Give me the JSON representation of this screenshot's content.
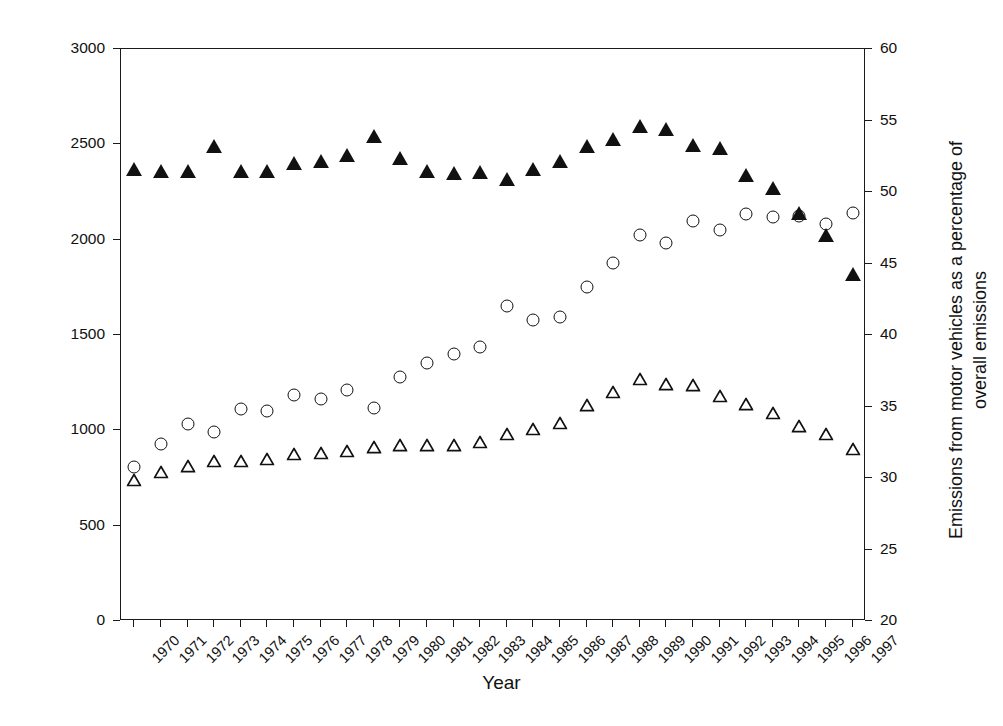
{
  "axes": {
    "x": {
      "label": "Year",
      "ticks": [
        "1970",
        "1971",
        "1972",
        "1973",
        "1974",
        "1975",
        "1976",
        "1977",
        "1978",
        "1979",
        "1980",
        "1981",
        "1982",
        "1983",
        "1984",
        "1985",
        "1986",
        "1987",
        "1988",
        "1989",
        "1990",
        "1991",
        "1992",
        "1993",
        "1994",
        "1995",
        "1996",
        "1997"
      ]
    },
    "y_left": {
      "label": "Annual emission in ktonnes",
      "ticks": [
        "0",
        "500",
        "1000",
        "1500",
        "2000",
        "2500",
        "3000"
      ],
      "min": 0,
      "max": 3000
    },
    "y_right": {
      "label": "Emissions from motor vehicles as a percentage of overall emissions",
      "ticks": [
        "20",
        "25",
        "30",
        "35",
        "40",
        "45",
        "50",
        "55",
        "60"
      ],
      "min": 20,
      "max": 60
    }
  },
  "chart_data": {
    "type": "scatter",
    "title": "",
    "xlabel": "Year",
    "ylabel": "Annual emission in ktonnes",
    "y2label": "Emissions from motor vehicles as a percentage of overall emissions",
    "grid": false,
    "legend": "none",
    "xlim": [
      1970,
      1997
    ],
    "ylim": [
      0,
      3000
    ],
    "y2lim": [
      20,
      60
    ],
    "categories": [
      "1970",
      "1971",
      "1972",
      "1973",
      "1974",
      "1975",
      "1976",
      "1977",
      "1978",
      "1979",
      "1980",
      "1981",
      "1982",
      "1983",
      "1984",
      "1985",
      "1986",
      "1987",
      "1988",
      "1989",
      "1990",
      "1991",
      "1992",
      "1993",
      "1994",
      "1995",
      "1996",
      "1997"
    ],
    "series": [
      {
        "name": "Total annual emission",
        "marker": "open-circle",
        "axis": "left",
        "unit": "ktonnes",
        "values": [
          810,
          930,
          1035,
          990,
          1110,
          1100,
          1185,
          1165,
          1210,
          1115,
          1280,
          1355,
          1400,
          1435,
          1650,
          1580,
          1595,
          1750,
          1880,
          2025,
          1985,
          2100,
          2050,
          2135,
          2120,
          2125,
          2080,
          2140
        ]
      },
      {
        "name": "Emission from motor vehicles",
        "marker": "open-triangle",
        "axis": "left",
        "unit": "ktonnes",
        "values": [
          745,
          785,
          815,
          845,
          845,
          855,
          880,
          885,
          895,
          915,
          925,
          925,
          925,
          945,
          985,
          1010,
          1045,
          1135,
          1205,
          1275,
          1245,
          1240,
          1185,
          1140,
          1095,
          1025,
          985,
          905
        ]
      },
      {
        "name": "Motor vehicles share of overall emissions",
        "marker": "filled-triangle",
        "axis": "right",
        "unit": "%",
        "values": [
          51.6,
          51.5,
          51.5,
          53.2,
          51.5,
          51.5,
          52.0,
          52.2,
          52.6,
          53.9,
          52.4,
          51.5,
          51.3,
          51.4,
          50.9,
          51.6,
          52.2,
          53.2,
          53.7,
          54.6,
          54.4,
          53.3,
          53.1,
          51.2,
          50.3,
          48.5,
          47.0,
          44.3
        ]
      }
    ]
  },
  "icons": {
    "open_circle": "open-circle-marker",
    "open_triangle": "open-triangle-marker",
    "filled_triangle": "filled-triangle-marker"
  }
}
